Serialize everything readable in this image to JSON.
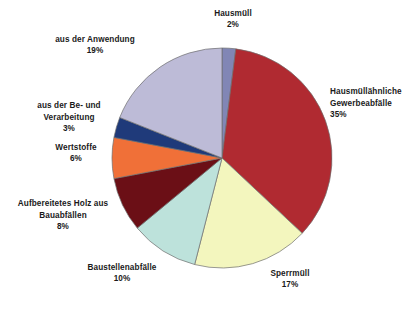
{
  "chart_data": {
    "type": "pie",
    "title": "",
    "subtitle": "",
    "xlabel": "",
    "ylabel": "",
    "legend_position": "none",
    "grid": false,
    "labels_show_percent": true,
    "start_angle_deg": 0,
    "direction": "clockwise",
    "categories": [
      "Hausmüll",
      "Hausmüllähnliche Gewerbeabfälle",
      "Sperrmüll",
      "Baustellenabfälle",
      "Aufbereitetes Holz aus Bauabfällen",
      "Wertstoffe",
      "aus der Be- und Verarbeitung",
      "aus der Anwendung"
    ],
    "values": [
      2,
      35,
      17,
      10,
      8,
      6,
      3,
      19
    ],
    "value_labels": [
      "2%",
      "35%",
      "17%",
      "10%",
      "8%",
      "6%",
      "3%",
      "19%"
    ],
    "colors": [
      "#8186B5",
      "#B02A31",
      "#F3F6BE",
      "#BDE2DB",
      "#6B0F16",
      "#F07038",
      "#1F3A7A",
      "#BDBBD7"
    ],
    "slice_border_color": "#6f6f6f",
    "total": 100,
    "units": "%"
  },
  "slices": {
    "hausmuell": {
      "name": "Hausmüll",
      "value": "2%"
    },
    "gewerbe": {
      "name": "Hausmüllähnliche\nGewerbeabfälle",
      "value": "35%"
    },
    "sperrmuell": {
      "name": "Sperrmüll",
      "value": "17%"
    },
    "baustellen": {
      "name": "Baustellenabfälle",
      "value": "10%"
    },
    "holz": {
      "name": "Aufbereitetes Holz aus\nBauabfällen",
      "value": "8%"
    },
    "wertstoffe": {
      "name": "Wertstoffe",
      "value": "6%"
    },
    "verarbeitung": {
      "name": "aus der Be- und\nVerarbeitung",
      "value": "3%"
    },
    "anwendung": {
      "name": "aus der Anwendung",
      "value": "19%"
    }
  }
}
